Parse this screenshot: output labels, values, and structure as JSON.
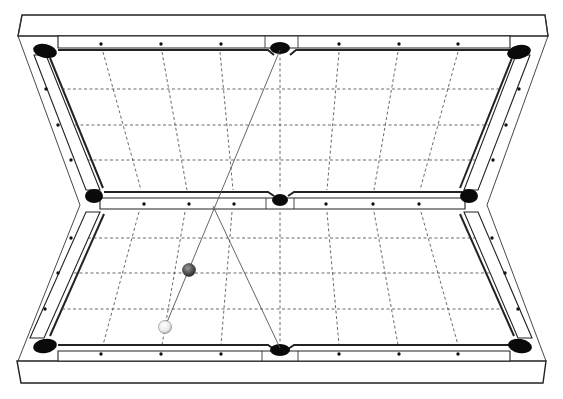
{
  "diagram": {
    "title": "",
    "colors": {
      "background": "#ffffff",
      "line": "#222222",
      "pocket": "#0a0a0a",
      "object_ball": "#555555",
      "cue_ball": "#f2f2f2",
      "grid": "#444444"
    },
    "tables": [
      {
        "name": "mirrored-table",
        "position": "top",
        "grid_columns": 8,
        "grid_rows": 4,
        "pockets": 6
      },
      {
        "name": "real-table",
        "position": "bottom",
        "grid_columns": 8,
        "grid_rows": 4,
        "pockets": 6
      }
    ],
    "balls": [
      {
        "name": "cue-ball",
        "color": "white",
        "x": 165,
        "y": 327
      },
      {
        "name": "object-ball",
        "color": "dark-grey",
        "x": 189,
        "y": 270
      }
    ],
    "shot_path": {
      "segments": [
        {
          "name": "aim-line",
          "from": "cue-ball",
          "to": "mirrored-side-pocket"
        },
        {
          "name": "bank-line",
          "from": "rail-contact",
          "to": "bottom-side-pocket"
        }
      ]
    },
    "labels": []
  }
}
